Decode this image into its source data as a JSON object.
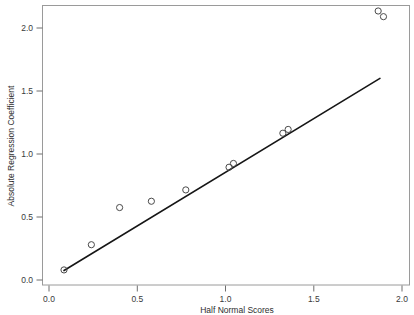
{
  "chart_data": {
    "type": "scatter",
    "title": "",
    "xlabel": "Half Normal Scores",
    "ylabel": "Absolute Regression Coefficient",
    "xlim": [
      -0.045,
      2.05
    ],
    "ylim": [
      -0.04,
      2.22
    ],
    "grid": false,
    "legend": "none",
    "xticks": [
      0.0,
      0.5,
      1.0,
      1.5,
      2.0
    ],
    "xticklabels": [
      "0.0",
      "0.5",
      "1.0",
      "1.5",
      "2.0"
    ],
    "yticks": [
      0.0,
      0.5,
      1.0,
      1.5,
      2.0
    ],
    "yticklabels": [
      "0.0",
      "0.5",
      "1.0",
      "1.5",
      "2.0"
    ],
    "marker": "open-circle",
    "points": [
      {
        "x": 0.085,
        "y": 0.08
      },
      {
        "x": 0.24,
        "y": 0.28
      },
      {
        "x": 0.4,
        "y": 0.575
      },
      {
        "x": 0.58,
        "y": 0.625
      },
      {
        "x": 0.775,
        "y": 0.715
      },
      {
        "x": 1.02,
        "y": 0.895
      },
      {
        "x": 1.045,
        "y": 0.925
      },
      {
        "x": 1.325,
        "y": 1.165
      },
      {
        "x": 1.355,
        "y": 1.195
      },
      {
        "x": 1.865,
        "y": 2.135
      },
      {
        "x": 1.895,
        "y": 2.09
      }
    ],
    "reference_line": {
      "type": "line",
      "x": [
        0.085,
        1.875
      ],
      "y": [
        0.075,
        1.6
      ],
      "slope": 0.852,
      "intercept": 0.0026
    }
  },
  "axis_labels": {
    "x_title": "Half Normal Scores",
    "y_title": "Absolute Regression Coefficient"
  },
  "ticks": {
    "x": [
      "0.0",
      "0.5",
      "1.0",
      "1.5",
      "2.0"
    ],
    "y": [
      "0.0",
      "0.5",
      "1.0",
      "1.5",
      "2.0"
    ]
  },
  "colors": {
    "background": "#ffffff",
    "frame": "#9a9a9a",
    "marker_stroke": "#4a4a4a",
    "line": "#161616",
    "text": "#2e2e2e"
  }
}
